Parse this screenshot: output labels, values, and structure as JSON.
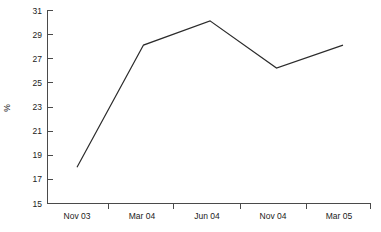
{
  "chart_data": {
    "type": "line",
    "title": "",
    "subtitle": "",
    "xlabel": "",
    "ylabel": "%",
    "categories": [
      "Nov 03",
      "Mar 04",
      "Jun 04",
      "Nov 04",
      "Mar 05"
    ],
    "series": [
      {
        "name": "",
        "values": [
          18.0,
          28.1,
          30.1,
          26.2,
          28.1
        ]
      }
    ],
    "ylim": [
      15,
      31
    ],
    "yticks": [
      15,
      17,
      19,
      21,
      23,
      25,
      27,
      29,
      31
    ],
    "ytick_labels": [
      "15",
      "17",
      "19",
      "21",
      "23",
      "25",
      "27",
      "29",
      "31"
    ],
    "xtick_labels": [
      "Nov 03",
      "Mar 04",
      "Jun 04",
      "Nov 04",
      "Mar 05"
    ],
    "grid": false,
    "legend": null,
    "legend_position": "none",
    "annotations": [],
    "line_color": "#2b2b2b",
    "axis_color": "#4a4a4a",
    "background_color": "#ffffff"
  }
}
